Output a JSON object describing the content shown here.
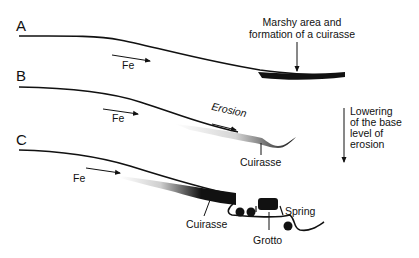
{
  "panels": [
    {
      "id": "A",
      "label": "A",
      "annotations": {
        "flow": "Fe",
        "note_line1": "Marshy area and",
        "note_line2": "formation of a cuirasse"
      }
    },
    {
      "id": "B",
      "label": "B",
      "annotations": {
        "flow": "Fe",
        "erosion": "Erosion",
        "cuirasse": "Cuirasse"
      }
    },
    {
      "id": "C",
      "label": "C",
      "annotations": {
        "flow": "Fe",
        "cuirasse": "Cuirasse",
        "grotto": "Grotto",
        "spring": "Spring"
      }
    }
  ],
  "side_note": {
    "line1": "Lowering",
    "line2": "of the base",
    "line3": "level of",
    "line4": "erosion"
  },
  "colors": {
    "ink": "#111111",
    "shade": "#bdbdbd",
    "background": "#ffffff"
  }
}
